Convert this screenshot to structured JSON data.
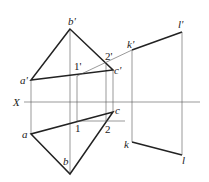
{
  "diagram": {
    "type": "orthographic projection (descriptive geometry)",
    "axis_label": "X",
    "labels": {
      "b_prime": "b'",
      "a_prime": "a'",
      "c_prime": "c'",
      "one_prime": "1'",
      "two_prime": "2'",
      "k_prime": "k'",
      "l_prime": "l'",
      "a": "a",
      "b": "b",
      "c": "c",
      "one": "1",
      "two": "2",
      "k": "k",
      "l": "l"
    },
    "colors": {
      "line": "#222222",
      "thin_line": "#555555",
      "background": "#ffffff"
    }
  }
}
